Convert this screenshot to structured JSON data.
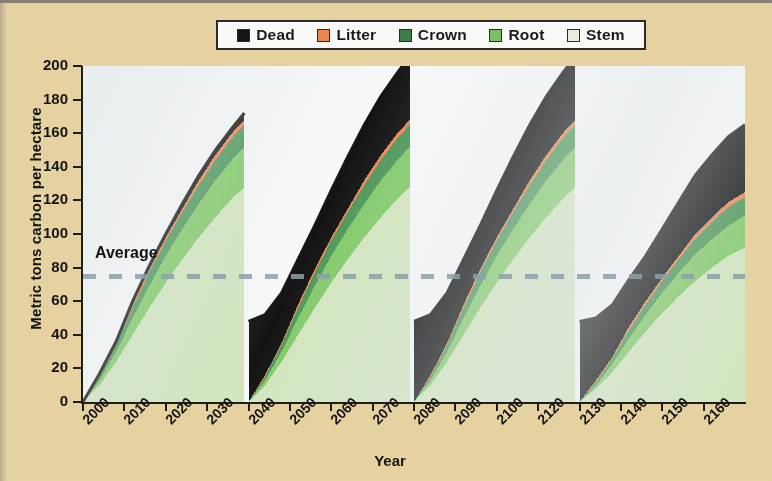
{
  "chart_data": {
    "type": "area",
    "title": "",
    "xlabel": "Year",
    "ylabel": "Metric tons carbon per hectare",
    "xlim": [
      2000,
      2160
    ],
    "ylim": [
      0,
      200
    ],
    "ytick_values": [
      0,
      20,
      40,
      60,
      80,
      100,
      120,
      140,
      160,
      180,
      200
    ],
    "xtick_labels": [
      "2000",
      "2010",
      "2020",
      "2030",
      "2040",
      "2050",
      "2060",
      "2070",
      "2080",
      "2090",
      "2100",
      "2120",
      "2130",
      "2140",
      "2150",
      "2160"
    ],
    "xtick_values": [
      2000,
      2010,
      2020,
      2030,
      2040,
      2050,
      2060,
      2070,
      2080,
      2090,
      2100,
      2110,
      2120,
      2130,
      2140,
      2150
    ],
    "grid": false,
    "stacked": true,
    "legend_position": "top",
    "annotation": {
      "label": "Average",
      "value": 75,
      "style": "dashed-horizontal-line",
      "color": "#8fa3ad"
    },
    "series": [
      {
        "name": "Stem",
        "color": "#d6e9c2",
        "order": 1
      },
      {
        "name": "Root",
        "color": "#86cd6c",
        "order": 2
      },
      {
        "name": "Crown",
        "color": "#4f9a5c",
        "order": 3
      },
      {
        "name": "Litter",
        "color": "#e98a52",
        "order": 4
      },
      {
        "name": "Dead",
        "color": "#141414",
        "order": 5
      }
    ],
    "x": [
      2000,
      2004,
      2008,
      2012,
      2016,
      2020,
      2024,
      2028,
      2032,
      2036,
      2039,
      2040,
      2044,
      2048,
      2052,
      2056,
      2060,
      2064,
      2068,
      2072,
      2076,
      2079,
      2080,
      2084,
      2088,
      2092,
      2096,
      2100,
      2104,
      2108,
      2112,
      2116,
      2119,
      2120,
      2124,
      2128,
      2132,
      2136,
      2140,
      2144,
      2148,
      2152,
      2156,
      2160
    ],
    "values": {
      "Stem": [
        0,
        10,
        24,
        40,
        56,
        71,
        85,
        98,
        110,
        121,
        128,
        0,
        10,
        24,
        40,
        56,
        71,
        85,
        98,
        110,
        121,
        128,
        0,
        10,
        24,
        40,
        56,
        71,
        85,
        98,
        110,
        121,
        128,
        0,
        8,
        18,
        30,
        42,
        53,
        63,
        72,
        80,
        87,
        92
      ],
      "Root": [
        0,
        3,
        6,
        10,
        13,
        16,
        18,
        20,
        22,
        23,
        24,
        0,
        3,
        6,
        10,
        13,
        16,
        18,
        20,
        22,
        23,
        24,
        0,
        3,
        6,
        10,
        13,
        16,
        18,
        20,
        22,
        23,
        24,
        0,
        2,
        5,
        8,
        10,
        12,
        14,
        16,
        17,
        18,
        19
      ],
      "Crown": [
        0,
        2,
        4,
        6,
        8,
        9,
        10,
        11,
        12,
        13,
        13,
        0,
        2,
        4,
        6,
        8,
        9,
        10,
        11,
        12,
        13,
        13,
        0,
        2,
        4,
        6,
        8,
        9,
        10,
        11,
        12,
        13,
        13,
        0,
        2,
        3,
        5,
        6,
        7,
        8,
        9,
        10,
        11,
        11
      ],
      "Litter": [
        0,
        1,
        1,
        2,
        2,
        2,
        2,
        3,
        3,
        3,
        3,
        0,
        1,
        1,
        2,
        2,
        2,
        2,
        3,
        3,
        3,
        3,
        0,
        1,
        1,
        2,
        2,
        2,
        2,
        3,
        3,
        3,
        3,
        0,
        1,
        1,
        2,
        2,
        2,
        2,
        3,
        3,
        3,
        3
      ],
      "Dead": [
        0,
        1,
        1,
        2,
        2,
        2,
        3,
        3,
        3,
        3,
        4,
        48,
        36,
        30,
        27,
        26,
        28,
        31,
        33,
        35,
        36,
        38,
        48,
        36,
        30,
        27,
        26,
        28,
        31,
        33,
        35,
        36,
        38,
        48,
        37,
        31,
        28,
        27,
        29,
        32,
        35,
        37,
        39,
        40
      ]
    },
    "totals_peak": [
      172,
      173,
      173,
      102
    ],
    "cycle_reset_years": [
      2040,
      2080,
      2120
    ]
  },
  "legend": {
    "items": [
      {
        "label": "Dead",
        "color": "#141414"
      },
      {
        "label": "Litter",
        "color": "#e98a52"
      },
      {
        "label": "Crown",
        "color": "#3f7f49"
      },
      {
        "label": "Root",
        "color": "#7cc263"
      },
      {
        "label": "Stem",
        "color": "#eaf3e2"
      }
    ]
  },
  "axes": {
    "y_title": "Metric tons carbon per hectare",
    "x_title": "Year"
  },
  "annotation": {
    "average_label": "Average"
  }
}
